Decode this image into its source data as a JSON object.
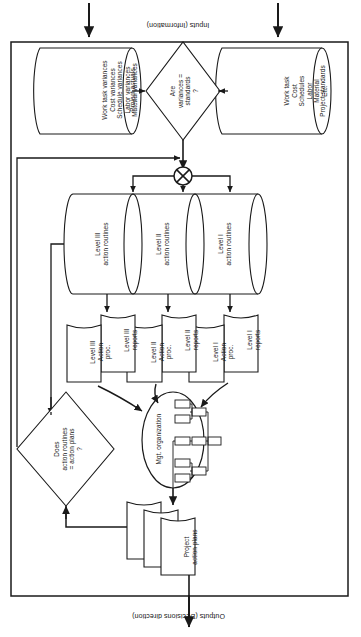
{
  "figure": {
    "rotation_degrees": 180,
    "outer_boundary_label": "system boundary"
  },
  "edge_labels": {
    "outputs": "Outputs (Decisions direction)",
    "inputs": "Inputs (Information)"
  },
  "nodes": {
    "project_action_plans": {
      "label": "Project\naction plans",
      "shape": "document-stack",
      "stack_count": 3
    },
    "mgt_organization": {
      "label": "Mgt. organization",
      "shape": "ellipse-org-chart"
    },
    "decision_action": {
      "label": "Does\naction routines\n= action plans\n?",
      "shape": "diamond"
    },
    "decision_variance": {
      "label": "Are\nvariances =\nstandards\n?",
      "shape": "diamond"
    },
    "summation": {
      "label": "circle-x",
      "shape": "circle-cross"
    },
    "project_standards": {
      "header": "Project standards",
      "shape": "cylinder",
      "items": [
        "Work task",
        "Cost",
        "Schedules",
        "Labor",
        "Material",
        "Etc."
      ]
    },
    "project_actuals": {
      "header": "Project actuals",
      "shape": "cylinder",
      "items": [
        "Work task variances",
        "Cost variances",
        "Schedule variances",
        "Labor variances",
        "Material variances"
      ]
    },
    "action_routines": {
      "shape": "cylinder-stack",
      "cylinders": [
        {
          "label": "Level I\naction routines"
        },
        {
          "label": "Level II\naction routines"
        },
        {
          "label": "Level III\naction routines"
        }
      ]
    },
    "reports": [
      {
        "report": "Level I\nreports",
        "proc": "Level I\nAction\nproc."
      },
      {
        "report": "Level II\nreports",
        "proc": "Level II\nAction\nproc."
      },
      {
        "report": "Level III\nreports",
        "proc": "Level III\nAction\nproc."
      }
    ]
  },
  "colors": {
    "line": "#1a1a1a",
    "fill": "#ffffff",
    "text": "#141414",
    "background": "#ffffff"
  }
}
